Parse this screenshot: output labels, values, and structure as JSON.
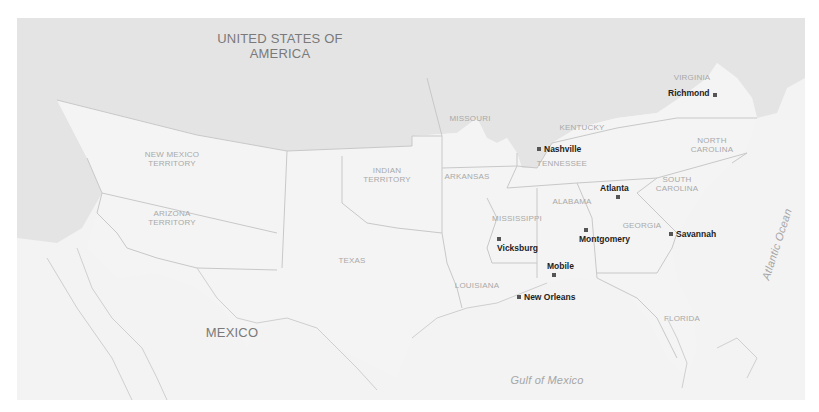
{
  "map": {
    "colors": {
      "union": "#e6e6e6",
      "confederacy": "#f5f5f5",
      "territory": "#f2f2f2",
      "mexico": "#f4f4f4",
      "water": "#f6f6f6",
      "border": "#c8c8c8",
      "city_marker": "#555555"
    },
    "countries": {
      "usa_line1": "UNITED STATES OF",
      "usa_line2": "AMERICA",
      "mexico": "MEXICO"
    },
    "water_bodies": {
      "gulf": "Gulf of Mexico",
      "atlantic": "Atlantic Ocean"
    },
    "regions": [
      {
        "line1": "NEW MEXICO",
        "line2": "TERRITORY"
      },
      {
        "line1": "ARIZONA",
        "line2": "TERRITORY"
      },
      {
        "line1": "INDIAN",
        "line2": "TERRITORY"
      },
      {
        "line1": "TEXAS"
      },
      {
        "line1": "MISSOURI"
      },
      {
        "line1": "ARKANSAS"
      },
      {
        "line1": "LOUISIANA"
      },
      {
        "line1": "MISSISSIPPI"
      },
      {
        "line1": "ALABAMA"
      },
      {
        "line1": "TENNESSEE"
      },
      {
        "line1": "KENTUCKY"
      },
      {
        "line1": "GEORGIA"
      },
      {
        "line1": "FLORIDA"
      },
      {
        "line1": "SOUTH",
        "line2": "CAROLINA"
      },
      {
        "line1": "NORTH",
        "line2": "CAROLINA"
      },
      {
        "line1": "VIRGINIA"
      }
    ],
    "cities": [
      {
        "name": "Richmond"
      },
      {
        "name": "Nashville"
      },
      {
        "name": "Atlanta"
      },
      {
        "name": "Montgomery"
      },
      {
        "name": "Savannah"
      },
      {
        "name": "Vicksburg"
      },
      {
        "name": "Mobile"
      },
      {
        "name": "New Orleans"
      }
    ]
  }
}
